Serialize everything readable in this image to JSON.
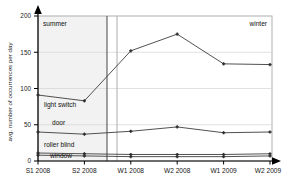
{
  "chart_data": {
    "type": "line",
    "title": "",
    "xlabel": "",
    "ylabel": "avg. number of occurrences per day",
    "categories": [
      "S1 2008",
      "S2 2008",
      "W1 2008",
      "W2 2008",
      "W1 2009",
      "W2 2009"
    ],
    "ylim": [
      0,
      200
    ],
    "yticks": [
      0,
      50,
      100,
      150,
      200
    ],
    "ytick_labels": [
      "0",
      "50",
      "100",
      "150",
      "200"
    ],
    "grid": true,
    "legend": "inline-labels",
    "series": [
      {
        "name": "light switch",
        "values": [
          91,
          83,
          152,
          175,
          134,
          133
        ]
      },
      {
        "name": "door",
        "values": [
          40,
          37,
          41,
          47,
          39,
          40
        ]
      },
      {
        "name": "roller blind",
        "values": [
          11,
          10,
          9,
          9,
          9,
          10
        ]
      },
      {
        "name": "window",
        "values": [
          8,
          7,
          6,
          6,
          6,
          7
        ]
      }
    ],
    "annotations": [
      {
        "name": "summer",
        "text": "summer",
        "position": "top-left"
      },
      {
        "name": "winter",
        "text": "winter",
        "position": "top-right"
      }
    ],
    "regions": [
      {
        "name": "summer-region",
        "from": "S1 2008",
        "to": "S2 2008",
        "shaded": true
      }
    ],
    "colors": {
      "line": "#3d3d3d",
      "axis": "#000000",
      "grid": "#d2d2d2",
      "shade": "#f1f1f1",
      "frame": "#9a9a9a",
      "text": "#111111"
    }
  }
}
